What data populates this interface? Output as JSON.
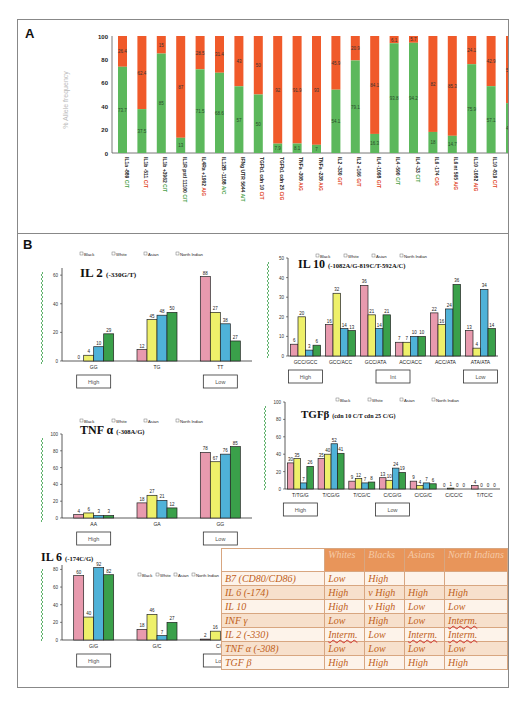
{
  "panels": {
    "A": "A",
    "B": "B",
    "C": "C"
  },
  "chart_data": [
    {
      "id": "A",
      "type": "bar",
      "stacked": true,
      "ylabel": "% Allele frequency",
      "ylim": [
        0,
        100
      ],
      "yticks": [
        0,
        20,
        40,
        60,
        80,
        100
      ],
      "categories": [
        "IL1a -889 C/T",
        "IL1b -511 C/T",
        "IL1b +3962 C/T",
        "IL1R pstI 11100 C/T",
        "IL4Ra +1902 A/G",
        "IL12B -1188 A/C",
        "IFNg UTR 5644 A/T",
        "TGFb1 cdn 10 C/T",
        "TGFb1 cdn 25 C/G",
        "TNFa -308 A/G",
        "TNFa -238 A/G",
        "IL2 -330 G/T",
        "IL2 +166 G/T",
        "IL4 -1098 G/T",
        "IL4 -590 C/T",
        "IL4 -33 C/T",
        "IL6 -174 C/G",
        "IL6 nt 565 A/G",
        "IL10 -1082 A/G",
        "IL10 -819 C/T",
        "IL10 -592 A/C"
      ],
      "series": [
        {
          "name": "Allele 1",
          "color": "#5cb85c",
          "values": [
            73.7,
            37.5,
            85,
            13,
            71.5,
            68.6,
            57,
            50,
            8,
            8.1,
            7,
            54.1,
            79.1,
            16.3,
            93.8,
            94.2,
            18,
            14.7,
            75.9,
            57.1,
            42.6
          ]
        },
        {
          "name": "Allele 2",
          "color": "#f05a2a",
          "values": [
            26.4,
            62.4,
            15,
            87,
            28.5,
            31.4,
            43,
            50,
            92,
            91.9,
            93,
            45.9,
            20.9,
            84.1,
            6.2,
            5.7,
            82,
            85.3,
            24.1,
            42.9,
            57.4
          ]
        }
      ],
      "labels": {
        "allele1": [
          "73.7",
          "37.5",
          "85",
          "13",
          "71.5",
          "68.6",
          "57",
          "50",
          "7.9",
          "8.1",
          "7",
          "54.1",
          "79.1",
          "16.3",
          "93.8",
          "94.2",
          "18",
          "14.7",
          "75.9",
          "57.1",
          "42.6"
        ],
        "allele2": [
          "26.4",
          "62.4",
          "15",
          "87",
          "28.5",
          "31.4",
          "43",
          "50",
          "92",
          "91.9",
          "93",
          "45.9",
          "20.9",
          "84.1",
          "6.1",
          "5.7",
          "82",
          "85.3",
          "24.1",
          "42.9",
          "57.4"
        ]
      }
    },
    {
      "id": "IL2",
      "type": "bar",
      "title": "IL 2",
      "subtitle": "(-330G/T)",
      "legend": [
        "Black",
        "White",
        "Asian",
        "North Indian"
      ],
      "categories": [
        "GG",
        "TG",
        "TT"
      ],
      "ylim": [
        0,
        65
      ],
      "yticks": [
        0,
        20,
        40,
        60
      ],
      "series": [
        {
          "name": "Black",
          "values": [
            0,
            8,
            59
          ]
        },
        {
          "name": "White",
          "values": [
            4,
            29,
            34
          ]
        },
        {
          "name": "Asian",
          "values": [
            10,
            32,
            26
          ]
        },
        {
          "name": "North Indian",
          "values": [
            19,
            34,
            14
          ]
        }
      ],
      "value_labels": [
        [
          "0",
          "4",
          "10",
          "29"
        ],
        [
          "12",
          "45",
          "48",
          "50"
        ],
        [
          "88",
          "27",
          "38",
          "27"
        ]
      ],
      "boxes": [
        {
          "label": "High",
          "under": 0
        },
        {
          "label": "Low",
          "under": 2
        }
      ]
    },
    {
      "id": "IL10",
      "type": "bar",
      "title": "IL 10",
      "subtitle": "(-1082A/G-819C/T-592A/C)",
      "legend": [
        "Black",
        "White",
        "Asian",
        "North Indian"
      ],
      "categories": [
        "GCC/GCC",
        "GCC/ACC",
        "GCC/ATA",
        "ACC/ACC",
        "ACC/ATA",
        "ATA/ATA"
      ],
      "ylim": [
        0,
        50
      ],
      "yticks": [
        0,
        10,
        20,
        30,
        40,
        50
      ],
      "series": [
        {
          "name": "Black",
          "values": [
            6,
            16,
            36,
            7,
            22,
            13
          ]
        },
        {
          "name": "White",
          "values": [
            20,
            32,
            21,
            7,
            16,
            4
          ]
        },
        {
          "name": "Asian",
          "values": [
            3,
            14,
            14,
            10,
            24,
            34
          ]
        },
        {
          "name": "North Indian",
          "values": [
            5.5,
            13,
            21,
            10,
            36.5,
            14
          ]
        }
      ],
      "value_labels": [
        [
          "6",
          "20",
          "3",
          "6"
        ],
        [
          "16",
          "32",
          "14",
          "13"
        ],
        [
          "36",
          "21",
          "14",
          "21"
        ],
        [
          "7",
          "7",
          "10",
          "10"
        ],
        [
          "22",
          "16",
          "24",
          "36"
        ],
        [
          "13",
          "4",
          "34",
          "14"
        ]
      ],
      "boxes": [
        {
          "label": "High",
          "under": 0
        },
        {
          "label": "Int",
          "under": 2.5
        },
        {
          "label": "Low",
          "under": 5
        }
      ]
    },
    {
      "id": "TNFa",
      "type": "bar",
      "title": "TNF α",
      "subtitle": "(-308A/G)",
      "legend": [
        "Black",
        "White",
        "Asian",
        "North Indian"
      ],
      "categories": [
        "AA",
        "GA",
        "GG"
      ],
      "ylim": [
        0,
        100
      ],
      "yticks": [
        0,
        20,
        40,
        60,
        80,
        100
      ],
      "series": [
        {
          "name": "Black",
          "values": [
            4,
            18,
            78
          ]
        },
        {
          "name": "White",
          "values": [
            6,
            27,
            67
          ]
        },
        {
          "name": "Asian",
          "values": [
            3,
            21,
            76
          ]
        },
        {
          "name": "North Indian",
          "values": [
            3,
            12,
            85
          ]
        }
      ],
      "value_labels": [
        [
          "4",
          "6",
          "3",
          "3"
        ],
        [
          "18",
          "27",
          "21",
          "12"
        ],
        [
          "78",
          "67",
          "76",
          "85"
        ]
      ],
      "boxes": [
        {
          "label": "High",
          "under": 0
        },
        {
          "label": "Low",
          "under": 2
        }
      ]
    },
    {
      "id": "TGFb",
      "type": "bar",
      "title": "TGFβ",
      "subtitle": "(cdn 10 C/T cdn 25 C/G)",
      "legend": [
        "Black",
        "White",
        "Asian",
        "North Indian"
      ],
      "categories": [
        "T/TG/G",
        "T/CG/G",
        "T/CG/C",
        "C/CG/G",
        "C/CG/C",
        "C/CC/C",
        "T/TC/C"
      ],
      "ylim": [
        0,
        100
      ],
      "yticks": [
        0,
        20,
        40,
        60,
        80,
        100
      ],
      "series": [
        {
          "name": "Black",
          "values": [
            30,
            35,
            9,
            13,
            9,
            0,
            4
          ]
        },
        {
          "name": "White",
          "values": [
            35,
            40,
            12,
            10,
            4,
            1,
            0
          ]
        },
        {
          "name": "Asian",
          "values": [
            7,
            52,
            7,
            24,
            7,
            0,
            0
          ]
        },
        {
          "name": "North Indian",
          "values": [
            26,
            41,
            8,
            19,
            6,
            0,
            0
          ]
        }
      ],
      "value_labels": [
        [
          "30",
          "35",
          "7",
          "26"
        ],
        [
          "35",
          "40",
          "52",
          "41"
        ],
        [
          "9",
          "12",
          "7",
          "8"
        ],
        [
          "13",
          "10",
          "24",
          "19"
        ],
        [
          "9",
          "4",
          "7",
          "6"
        ],
        [
          "0",
          "1",
          "0",
          "0"
        ],
        [
          "4",
          "0",
          "0",
          "0"
        ]
      ],
      "boxes": [
        {
          "label": "High",
          "under": 0
        },
        {
          "label": "Low",
          "under": 3
        }
      ]
    },
    {
      "id": "IL6",
      "type": "bar",
      "title": "IL 6",
      "subtitle": "(-174C/G)",
      "legend": [
        "Black",
        "White",
        "Asian",
        "North Indian"
      ],
      "categories": [
        "G/G",
        "G/C",
        "C/C"
      ],
      "ylim": [
        0,
        85
      ],
      "yticks": [
        0,
        20,
        40,
        60,
        80
      ],
      "series": [
        {
          "name": "Black",
          "values": [
            73,
            12,
            1
          ]
        },
        {
          "name": "White",
          "values": [
            26,
            29,
            10
          ]
        },
        {
          "name": "Asian",
          "values": [
            82,
            5,
            0
          ]
        },
        {
          "name": "North Indian",
          "values": [
            74,
            20,
            6
          ]
        }
      ],
      "value_labels": [
        [
          "60",
          "40",
          "92",
          "82"
        ],
        [
          "18",
          "46",
          "7",
          "27"
        ],
        [
          "2",
          "16",
          "0",
          "6"
        ]
      ],
      "boxes": [
        {
          "label": "High",
          "under": 0
        },
        {
          "label": "Low",
          "under": 2
        }
      ]
    }
  ],
  "colors": {
    "Black": "#e89aae",
    "White": "#eef06a",
    "Asian": "#4fb2d8",
    "North Indian": "#3aa04a",
    "allele1": "#5cb85c",
    "allele2": "#f05a2a"
  },
  "table_c": {
    "headers": [
      "",
      "Whites",
      "Blacks",
      "Asians",
      "North Indians"
    ],
    "rows": [
      {
        "label": "B7 (CD80/CD86)",
        "values": [
          "Low",
          "High",
          "",
          ""
        ]
      },
      {
        "label": "IL 6 (-174)",
        "values": [
          "High",
          "v High",
          "High",
          "High"
        ]
      },
      {
        "label": "IL 10",
        "values": [
          "High",
          "v High",
          "Low",
          "Low"
        ]
      },
      {
        "label": "INF γ",
        "values": [
          "Low",
          "High",
          "Low",
          "Interm."
        ]
      },
      {
        "label": "IL 2 (-330)",
        "values": [
          "Interm.",
          "Low",
          "Interm.",
          "Interm."
        ]
      },
      {
        "label": "TNF α (-308)",
        "values": [
          "Low",
          "Low",
          "Low",
          "Low"
        ]
      },
      {
        "label": "TGF β",
        "values": [
          "High",
          "High",
          "High",
          "High"
        ]
      }
    ]
  }
}
